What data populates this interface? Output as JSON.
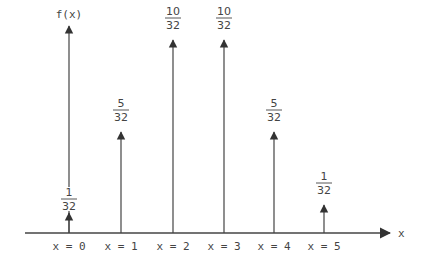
{
  "chart_data": {
    "type": "bar",
    "subtype": "stem / impulse probability mass function",
    "title": "",
    "xlabel": "x",
    "ylabel": "f(x)",
    "categories": [
      "x = 0",
      "x = 1",
      "x = 2",
      "x = 3",
      "x = 4",
      "x = 5"
    ],
    "x": [
      0,
      1,
      2,
      3,
      4,
      5
    ],
    "values": [
      0.03125,
      0.15625,
      0.3125,
      0.3125,
      0.15625,
      0.03125
    ],
    "value_labels": [
      {
        "num": "1",
        "den": "32"
      },
      {
        "num": "5",
        "den": "32"
      },
      {
        "num": "10",
        "den": "32"
      },
      {
        "num": "10",
        "den": "32"
      },
      {
        "num": "5",
        "den": "32"
      },
      {
        "num": "1",
        "den": "32"
      }
    ],
    "ylim": [
      0,
      0.35
    ],
    "grid": false,
    "legend": null,
    "colors": {
      "line": "#333333",
      "text": "#333333",
      "background": "#ffffff"
    }
  }
}
